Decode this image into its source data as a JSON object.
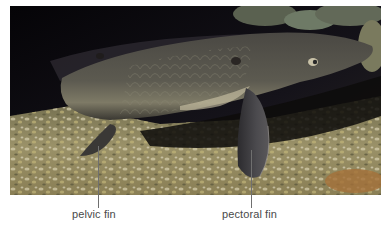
{
  "figure": {
    "labels": [
      {
        "id": "pelvic",
        "text": "pelvic fin"
      },
      {
        "id": "pectoral",
        "text": "pectoral fin"
      }
    ]
  },
  "colors": {
    "background": "#ffffff",
    "label_text": "#4a4a4a",
    "leader_line": "#6f6f6f",
    "water_dark": "#0b0a0c",
    "fish_body": "#55524a",
    "gravel": "#9c9468"
  }
}
